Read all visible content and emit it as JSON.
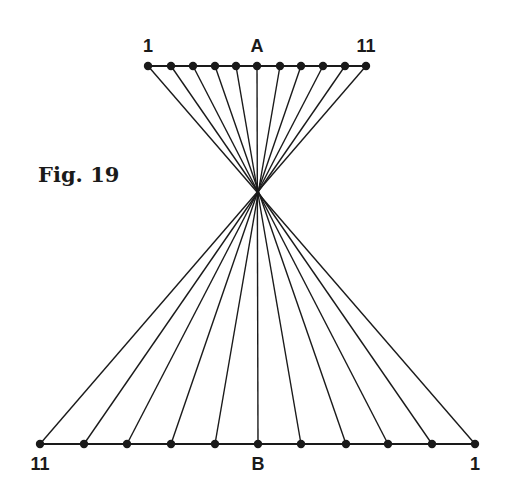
{
  "figure": {
    "caption": "Fig. 19",
    "ink_color": "#1a1a1a",
    "background": "#ffffff"
  },
  "line_a": {
    "label": "A",
    "left_label": "1",
    "right_label": "11",
    "y": 66,
    "points_x": [
      148,
      171,
      193,
      215,
      236,
      257,
      280,
      301,
      323,
      345,
      366
    ]
  },
  "line_b": {
    "label": "B",
    "left_label": "11",
    "right_label": "1",
    "y": 444,
    "points_x": [
      40,
      84,
      127,
      171,
      215,
      258,
      301,
      346,
      388,
      432,
      475
    ]
  },
  "crossing_point": {
    "x": 257,
    "y": 192
  },
  "point_count": 11
}
